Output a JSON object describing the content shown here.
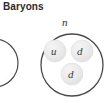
{
  "figure": {
    "title": "Baryons",
    "background_color": "#ffffff",
    "outline_color": "#4a4a4a",
    "quark_fill_color": "#ebebeb",
    "quark_edge_color": "#dcdcdc",
    "text_color": "#2b2b2b"
  },
  "particles": [
    {
      "name": "partial-baryon-left",
      "label": "",
      "visible": "partial",
      "cx": -6,
      "cy": 63,
      "r": 24,
      "quarks": []
    },
    {
      "name": "neutron",
      "label": "n",
      "visible": "full",
      "cx": 72,
      "cy": 65,
      "r": 31,
      "quarks": [
        {
          "symbol": "u",
          "position": "upper-left",
          "cx": 55,
          "cy": 51,
          "r": 11
        },
        {
          "symbol": "d",
          "position": "upper-right",
          "cx": 82,
          "cy": 51,
          "r": 11
        },
        {
          "symbol": "d",
          "position": "bottom",
          "cx": 72,
          "cy": 74,
          "r": 11
        }
      ]
    }
  ]
}
